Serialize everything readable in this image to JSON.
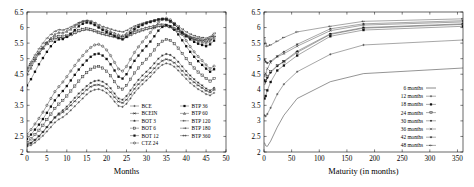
{
  "figure": {
    "panels": [
      "left",
      "right"
    ]
  },
  "chart_data": [
    {
      "id": "left",
      "type": "line",
      "title": "",
      "xlabel": "Months",
      "ylabel": "",
      "xlim": [
        0,
        50
      ],
      "ylim": [
        2,
        6.5
      ],
      "xticks": [
        0,
        5,
        10,
        15,
        20,
        25,
        30,
        35,
        40,
        45,
        50
      ],
      "xtick_labels": [
        "0",
        "5",
        "10",
        "15",
        "20",
        "25",
        "30",
        "35",
        "40",
        "45",
        "50"
      ],
      "yticks": [
        2,
        2.5,
        3,
        3.5,
        4,
        4.5,
        5,
        5.5,
        6,
        6.5
      ],
      "ytick_labels": [
        "2",
        "2.5",
        "3",
        "3.5",
        "4",
        "4.5",
        "5",
        "5.5",
        "6",
        "6.5"
      ],
      "grid": false,
      "legend_position": "lower-right",
      "legend_columns": 2,
      "x": [
        0,
        1,
        2,
        3,
        4,
        5,
        6,
        7,
        8,
        9,
        10,
        11,
        12,
        13,
        14,
        15,
        16,
        17,
        18,
        19,
        20,
        21,
        22,
        23,
        24,
        25,
        26,
        27,
        28,
        29,
        30,
        31,
        32,
        33,
        34,
        35,
        36,
        37,
        38,
        39,
        40,
        41,
        42,
        43,
        44,
        45,
        46,
        47
      ],
      "series": [
        {
          "name": "BCE",
          "marker": "plus",
          "values": [
            2.18,
            2.22,
            2.3,
            2.41,
            2.52,
            2.66,
            2.8,
            2.95,
            3.05,
            3.12,
            3.22,
            3.34,
            3.47,
            3.6,
            3.72,
            3.85,
            3.95,
            4.0,
            4.02,
            3.98,
            3.9,
            3.78,
            3.62,
            3.48,
            3.45,
            3.55,
            3.72,
            3.9,
            4.05,
            4.18,
            4.3,
            4.42,
            4.56,
            4.7,
            4.8,
            4.85,
            4.82,
            4.74,
            4.62,
            4.48,
            4.35,
            4.22,
            4.12,
            4.02,
            3.95,
            3.86,
            3.82,
            3.9
          ]
        },
        {
          "name": "BCEIN",
          "marker": "cross-line",
          "values": [
            2.24,
            2.3,
            2.4,
            2.52,
            2.65,
            2.8,
            2.95,
            3.1,
            3.2,
            3.28,
            3.38,
            3.5,
            3.63,
            3.76,
            3.88,
            4.0,
            4.1,
            4.15,
            4.16,
            4.12,
            4.04,
            3.92,
            3.76,
            3.62,
            3.58,
            3.68,
            3.85,
            4.03,
            4.18,
            4.31,
            4.43,
            4.55,
            4.69,
            4.83,
            4.93,
            4.98,
            4.95,
            4.87,
            4.75,
            4.61,
            4.48,
            4.35,
            4.24,
            4.14,
            4.06,
            3.97,
            3.92,
            4.0
          ]
        },
        {
          "name": "BOT 3",
          "marker": "star",
          "values": [
            2.2,
            2.28,
            2.38,
            2.5,
            2.64,
            2.8,
            2.96,
            3.12,
            3.24,
            3.34,
            3.46,
            3.6,
            3.74,
            3.88,
            4.0,
            4.12,
            4.22,
            4.28,
            4.3,
            4.26,
            4.18,
            4.05,
            3.88,
            3.72,
            3.68,
            3.8,
            3.98,
            4.16,
            4.32,
            4.46,
            4.58,
            4.7,
            4.85,
            5.0,
            5.1,
            5.15,
            5.12,
            5.03,
            4.9,
            4.75,
            4.6,
            4.46,
            4.34,
            4.23,
            4.14,
            4.04,
            3.98,
            4.06
          ]
        },
        {
          "name": "BOT 6",
          "marker": "square-open",
          "values": [
            2.3,
            2.42,
            2.56,
            2.7,
            2.86,
            3.04,
            3.22,
            3.4,
            3.54,
            3.66,
            3.8,
            3.96,
            4.12,
            4.28,
            4.42,
            4.55,
            4.66,
            4.73,
            4.75,
            4.7,
            4.6,
            4.45,
            4.26,
            4.08,
            4.02,
            4.14,
            4.34,
            4.54,
            4.7,
            4.85,
            4.98,
            5.12,
            5.28,
            5.45,
            5.56,
            5.62,
            5.58,
            5.48,
            5.34,
            5.17,
            5.0,
            4.84,
            4.7,
            4.57,
            4.47,
            4.36,
            4.28,
            4.36
          ]
        },
        {
          "name": "BOT 12",
          "marker": "square-filled",
          "values": [
            2.42,
            2.56,
            2.72,
            2.88,
            3.06,
            3.26,
            3.46,
            3.66,
            3.82,
            3.96,
            4.12,
            4.3,
            4.48,
            4.65,
            4.8,
            4.94,
            5.06,
            5.14,
            5.16,
            5.1,
            4.99,
            4.82,
            4.62,
            4.42,
            4.36,
            4.5,
            4.72,
            4.93,
            5.1,
            5.26,
            5.4,
            5.55,
            5.72,
            5.9,
            6.02,
            6.08,
            6.04,
            5.93,
            5.78,
            5.59,
            5.4,
            5.22,
            5.06,
            4.92,
            4.8,
            4.68,
            4.58,
            4.66
          ]
        },
        {
          "name": "CTZ 24",
          "marker": "circle-open",
          "values": [
            2.56,
            2.72,
            2.9,
            3.08,
            3.28,
            3.5,
            3.72,
            3.94,
            4.1,
            4.25,
            4.42,
            4.6,
            4.78,
            4.95,
            5.1,
            5.24,
            5.36,
            5.44,
            5.46,
            5.4,
            5.28,
            5.1,
            4.88,
            4.67,
            4.6,
            4.75,
            4.98,
            5.2,
            5.38,
            5.54,
            5.69,
            5.84,
            6.0,
            6.16,
            6.26,
            6.3,
            6.25,
            6.13,
            5.97,
            5.78,
            5.58,
            5.39,
            5.22,
            5.07,
            4.94,
            4.8,
            4.68,
            4.76
          ]
        },
        {
          "name": "BTP 36",
          "marker": "square-filled",
          "values": [
            4.14,
            4.34,
            4.58,
            4.82,
            5.02,
            5.22,
            5.4,
            5.54,
            5.62,
            5.63,
            5.7,
            5.8,
            5.92,
            6.04,
            6.12,
            6.16,
            6.14,
            6.08,
            6.0,
            5.92,
            5.86,
            5.8,
            5.73,
            5.66,
            5.62,
            5.7,
            5.82,
            5.94,
            6.02,
            6.08,
            6.14,
            6.18,
            6.22,
            6.26,
            6.28,
            6.26,
            6.2,
            6.1,
            5.98,
            5.84,
            5.72,
            5.62,
            5.54,
            5.48,
            5.44,
            5.4,
            5.46,
            5.58
          ]
        },
        {
          "name": "BTP 60",
          "marker": "triangle",
          "values": [
            4.5,
            4.7,
            4.94,
            5.16,
            5.34,
            5.52,
            5.66,
            5.78,
            5.84,
            5.83,
            5.88,
            5.95,
            6.04,
            6.13,
            6.19,
            6.21,
            6.18,
            6.12,
            6.04,
            5.97,
            5.92,
            5.87,
            5.82,
            5.77,
            5.74,
            5.81,
            5.9,
            5.99,
            6.06,
            6.11,
            6.16,
            6.19,
            6.22,
            6.25,
            6.27,
            6.25,
            6.19,
            6.1,
            5.99,
            5.87,
            5.76,
            5.68,
            5.61,
            5.56,
            5.53,
            5.5,
            5.56,
            5.68
          ]
        },
        {
          "name": "BTP 120",
          "marker": "arrow-left",
          "values": [
            4.66,
            4.84,
            5.04,
            5.22,
            5.38,
            5.52,
            5.62,
            5.7,
            5.74,
            5.73,
            5.76,
            5.81,
            5.87,
            5.93,
            5.97,
            5.99,
            5.97,
            5.93,
            5.88,
            5.84,
            5.81,
            5.78,
            5.75,
            5.72,
            5.7,
            5.75,
            5.81,
            5.87,
            5.92,
            5.96,
            6.0,
            6.03,
            6.06,
            6.09,
            6.11,
            6.1,
            6.06,
            6.0,
            5.93,
            5.85,
            5.78,
            5.72,
            5.68,
            5.65,
            5.63,
            5.61,
            5.66,
            5.76
          ]
        },
        {
          "name": "BTP 180",
          "marker": "arrow-right",
          "values": [
            4.7,
            4.9,
            5.12,
            5.32,
            5.5,
            5.66,
            5.78,
            5.88,
            5.93,
            5.92,
            5.96,
            6.02,
            6.09,
            6.16,
            6.21,
            6.23,
            6.21,
            6.16,
            6.09,
            6.03,
            5.99,
            5.95,
            5.91,
            5.88,
            5.86,
            5.91,
            5.98,
            6.05,
            6.1,
            6.14,
            6.18,
            6.21,
            6.24,
            6.27,
            6.29,
            6.27,
            6.22,
            6.14,
            6.05,
            5.95,
            5.86,
            5.79,
            5.74,
            5.7,
            5.68,
            5.66,
            5.71,
            5.82
          ]
        },
        {
          "name": "BTP 360",
          "marker": "arrow-double",
          "values": [
            4.6,
            4.78,
            4.98,
            5.16,
            5.32,
            5.46,
            5.56,
            5.64,
            5.68,
            5.67,
            5.7,
            5.75,
            5.81,
            5.87,
            5.91,
            5.93,
            5.91,
            5.87,
            5.82,
            5.78,
            5.75,
            5.72,
            5.69,
            5.66,
            5.64,
            5.69,
            5.75,
            5.81,
            5.86,
            5.9,
            5.94,
            5.97,
            6.0,
            6.03,
            6.05,
            6.04,
            6.0,
            5.94,
            5.87,
            5.79,
            5.72,
            5.67,
            5.63,
            5.6,
            5.58,
            5.56,
            5.61,
            5.71
          ]
        }
      ],
      "legend": [
        {
          "label": "BCE",
          "marker": "plus"
        },
        {
          "label": "BCEIN",
          "marker": "cross-line"
        },
        {
          "label": "BOT 3",
          "marker": "star"
        },
        {
          "label": "BOT 6",
          "marker": "square-open"
        },
        {
          "label": "BOT 12",
          "marker": "square-filled"
        },
        {
          "label": "CTZ 24",
          "marker": "circle-open"
        },
        {
          "label": "BTP 36",
          "marker": "square-filled"
        },
        {
          "label": "BTP 60",
          "marker": "triangle"
        },
        {
          "label": "BTP 120",
          "marker": "arrow-left"
        },
        {
          "label": "BTP 180",
          "marker": "arrow-right"
        },
        {
          "label": "BTP 360",
          "marker": "arrow-double"
        }
      ]
    },
    {
      "id": "right",
      "type": "line",
      "title": "",
      "xlabel": "Maturity (in months)",
      "ylabel": "",
      "xlim": [
        0,
        360
      ],
      "ylim": [
        2,
        6.5
      ],
      "xticks": [
        0,
        50,
        100,
        150,
        200,
        250,
        300,
        350
      ],
      "xtick_labels": [
        "0",
        "50",
        "100",
        "150",
        "200",
        "250",
        "300",
        "350"
      ],
      "yticks": [
        2,
        2.5,
        3,
        3.5,
        4,
        4.5,
        5,
        5.5,
        6,
        6.5
      ],
      "ytick_labels": [
        "2",
        "2.5",
        "3",
        "3.5",
        "4",
        "4.5",
        "5",
        "5.5",
        "6",
        "6.5"
      ],
      "grid": false,
      "legend_position": "lower-right",
      "legend_columns": 1,
      "x": [
        1,
        3,
        6,
        12,
        24,
        36,
        60,
        120,
        180,
        360
      ],
      "series": [
        {
          "name": "6 months",
          "marker": "line",
          "values": [
            2.3,
            2.2,
            2.18,
            2.35,
            2.8,
            3.18,
            3.72,
            4.26,
            4.52,
            4.7
          ]
        },
        {
          "name": "12 months",
          "marker": "plus",
          "values": [
            3.18,
            3.15,
            3.22,
            3.42,
            3.86,
            4.18,
            4.58,
            5.14,
            5.44,
            5.6
          ]
        },
        {
          "name": "18 months",
          "marker": "square-filled",
          "values": [
            3.72,
            3.8,
            3.98,
            4.25,
            4.62,
            4.78,
            5.1,
            5.72,
            5.92,
            6.04
          ]
        },
        {
          "name": "24 months",
          "marker": "square-open",
          "values": [
            4.22,
            4.3,
            4.42,
            4.58,
            4.78,
            4.9,
            5.2,
            5.78,
            5.98,
            6.1
          ]
        },
        {
          "name": "30 months",
          "marker": "diamond-filled",
          "values": [
            4.3,
            4.26,
            4.38,
            4.55,
            4.76,
            4.92,
            5.24,
            5.8,
            6.0,
            6.12
          ]
        },
        {
          "name": "36 months",
          "marker": "cross",
          "values": [
            4.44,
            4.52,
            4.68,
            4.88,
            5.06,
            5.16,
            5.4,
            5.9,
            6.08,
            6.18
          ]
        },
        {
          "name": "42 months",
          "marker": "star",
          "values": [
            4.96,
            4.9,
            4.86,
            4.92,
            5.08,
            5.22,
            5.46,
            5.96,
            6.12,
            6.22
          ]
        },
        {
          "name": "48 months",
          "marker": "arrow",
          "values": [
            5.68,
            5.48,
            5.4,
            5.44,
            5.56,
            5.68,
            5.86,
            6.04,
            6.2,
            6.28
          ]
        }
      ],
      "legend": [
        {
          "label": "6 months",
          "marker": "line"
        },
        {
          "label": "12 months",
          "marker": "plus"
        },
        {
          "label": "18 months",
          "marker": "square-filled"
        },
        {
          "label": "24 months",
          "marker": "square-open"
        },
        {
          "label": "30 months",
          "marker": "diamond-filled"
        },
        {
          "label": "36 months",
          "marker": "cross"
        },
        {
          "label": "42 months",
          "marker": "star"
        },
        {
          "label": "48 months",
          "marker": "arrow"
        }
      ]
    }
  ]
}
